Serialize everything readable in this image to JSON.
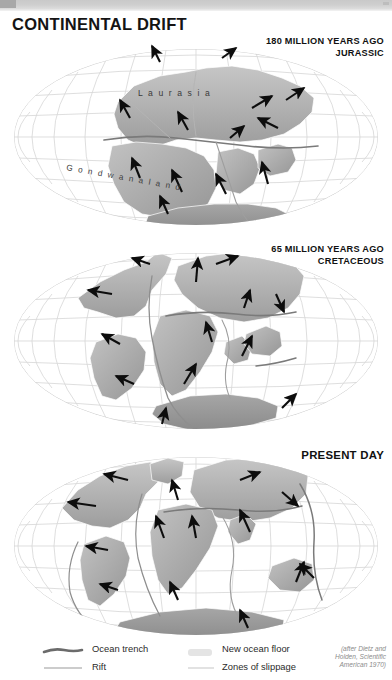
{
  "page": {
    "title": "CONTINENTAL DRIFT",
    "background": "#ffffff"
  },
  "colors": {
    "continent_light": "#b9b9b9",
    "continent_mid": "#a9a9a9",
    "continent_dark": "#8f8f8f",
    "antarctica": "#9a9a9a",
    "graticule": "#d6d6d6",
    "trench": "#6b6b6b",
    "rift": "#9a9a9a",
    "slippage": "#c9c9c9",
    "new_ocean_floor": "#e4e4e4",
    "arrow": "#0d0d0d",
    "text": "#141414",
    "credit_text": "#8c8c8c"
  },
  "panels": [
    {
      "id": "jurassic",
      "era_line1": "180 MILLION YEARS AGO",
      "era_line2": "JURASSIC",
      "landmass_labels": [
        {
          "name": "laurasia",
          "text": "L a u r a s i a"
        },
        {
          "name": "gondwanaland",
          "text": "G o n d w a n a l a n d"
        }
      ]
    },
    {
      "id": "cretaceous",
      "era_line1": "65 MILLION YEARS AGO",
      "era_line2": "CRETACEOUS",
      "landmass_labels": []
    },
    {
      "id": "present-day",
      "era_line1": "PRESENT DAY",
      "era_line2": "",
      "landmass_labels": []
    }
  ],
  "legend": {
    "items": [
      {
        "key": "ocean-trench",
        "label": "Ocean trench",
        "swatch": "thick-tapered-line",
        "color": "#6b6b6b"
      },
      {
        "key": "rift",
        "label": "Rift",
        "swatch": "thin-line",
        "color": "#9a9a9a"
      },
      {
        "key": "new-ocean-floor",
        "label": "New ocean floor",
        "swatch": "light-block",
        "color": "#e4e4e4"
      },
      {
        "key": "zones-of-slippage",
        "label": "Zones of slippage",
        "swatch": "faint-line",
        "color": "#cfcfcf"
      }
    ]
  },
  "credit": {
    "line1": "(after Dietz and",
    "line2": "Holden, Scientific",
    "line3": "American 1970)"
  }
}
